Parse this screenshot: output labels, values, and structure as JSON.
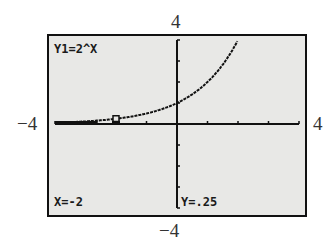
{
  "window_labels": {
    "ymax": "4",
    "ymin": "−4",
    "xmin": "−4",
    "xmax": "4"
  },
  "screen": {
    "equation": "Y1=2^X",
    "trace_x": "X=-2",
    "trace_y": "Y=.25"
  },
  "chart_data": {
    "type": "line",
    "title": "Y1=2^X",
    "function": "2^x",
    "xlim": [
      -4,
      4
    ],
    "ylim": [
      -4,
      4
    ],
    "xscl": 1,
    "yscl": 1,
    "x": [
      -4,
      -3,
      -2,
      -1,
      0,
      1,
      2
    ],
    "series": [
      {
        "name": "Y1",
        "values": [
          0.0625,
          0.125,
          0.25,
          0.5,
          1,
          2,
          4
        ]
      }
    ],
    "trace_point": {
      "x": -2,
      "y": 0.25
    },
    "grid": false,
    "xlabel": "",
    "ylabel": ""
  }
}
